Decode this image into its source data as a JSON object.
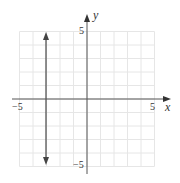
{
  "chart_data": {
    "type": "line",
    "title": "",
    "xlabel": "x",
    "ylabel": "y",
    "xlim": [
      -5,
      5
    ],
    "ylim": [
      -5,
      5
    ],
    "grid": true,
    "x_tick_labels": [
      "-5",
      "5"
    ],
    "y_tick_labels": [
      "5",
      "-5"
    ],
    "series": [
      {
        "name": "x = -3",
        "kind": "vertical-line",
        "x": -3,
        "y_range": [
          -4.7,
          4.7
        ],
        "arrows": "both"
      }
    ]
  },
  "labels": {
    "x_axis": "x",
    "y_axis": "y",
    "x_min": "−5",
    "x_max": "5",
    "y_max": "5",
    "y_min": "−5"
  },
  "colors": {
    "grid": "#e6e6e6",
    "axis": "#555555",
    "line": "#555555"
  }
}
